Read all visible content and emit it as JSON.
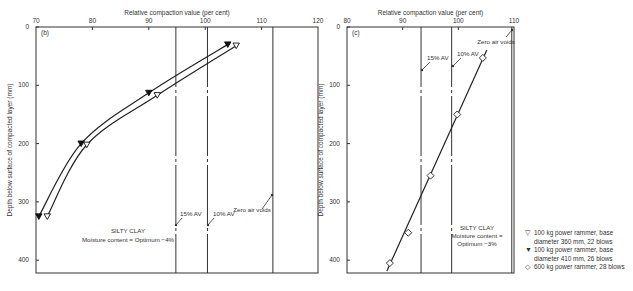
{
  "chart_data": [
    {
      "type": "line",
      "panel_label": "(b)",
      "title": "",
      "xlabel": "Relative compaction value (per cent)",
      "ylabel": "Depth below surface of compacted layer (mm)",
      "xlim": [
        70,
        120
      ],
      "ylim": [
        0,
        422
      ],
      "x_ticks": [
        "70",
        "80",
        "90",
        "100",
        "110",
        "120"
      ],
      "y_ticks": [
        "0",
        "100",
        "200",
        "300",
        "400"
      ],
      "grid": false,
      "annotation": [
        "SILTY CLAY",
        "Moisture content = Optimum −4%"
      ],
      "reference_lines": [
        {
          "label": "15% AV",
          "x": 94.8,
          "style": "dash-dot"
        },
        {
          "label": "10% AV",
          "x": 100.4,
          "style": "dash-dot"
        },
        {
          "label": "Zero air voids",
          "x": 112,
          "style": "solid"
        }
      ],
      "series": [
        {
          "name": "100 kg power rammer, base diameter 360 mm, 22 blows",
          "marker": "open-triangle-down",
          "points": [
            [
              105.5,
              32
            ],
            [
              91.5,
              117
            ],
            [
              79,
              202
            ],
            [
              72,
              325
            ]
          ]
        },
        {
          "name": "100 kg power rammer, base diameter 410 mm, 26 blows",
          "marker": "filled-triangle-down",
          "points": [
            [
              104,
              30
            ],
            [
              90,
              113
            ],
            [
              78,
              200
            ],
            [
              70.5,
              325
            ]
          ]
        }
      ]
    },
    {
      "type": "line",
      "panel_label": "(c)",
      "title": "",
      "xlabel": "Relative compaction value (per cent)",
      "ylabel": "Depth below surface of compacted layer (mm)",
      "xlim": [
        80,
        110
      ],
      "ylim": [
        0,
        422
      ],
      "x_ticks": [
        "80",
        "90",
        "100",
        "110"
      ],
      "y_ticks": [
        "0",
        "100",
        "200",
        "300",
        "400"
      ],
      "grid": false,
      "annotation": [
        "SILTY CLAY",
        "Moisture content =",
        "Optimum −3%"
      ],
      "reference_lines": [
        {
          "label": "15% AV",
          "x": 93.3,
          "style": "dash-dot"
        },
        {
          "label": "10% AV",
          "x": 98.8,
          "style": "dash-dot"
        },
        {
          "label": "Zero air voids",
          "x": 109.6,
          "style": "solid"
        }
      ],
      "series": [
        {
          "name": "600 kg power rammer, 28 blows",
          "marker": "open-diamond",
          "points": [
            [
              104.4,
              53
            ],
            [
              99.8,
              150
            ],
            [
              95,
              255
            ],
            [
              91,
              353
            ],
            [
              87.7,
              405
            ]
          ]
        }
      ]
    }
  ],
  "legend": [
    {
      "symbol": "▽",
      "lines": [
        "100 kg power rammer, base",
        "diameter 360 mm, 22 blows"
      ]
    },
    {
      "symbol": "▼",
      "lines": [
        "100 kg power rammer, base",
        "diameter 410 mm, 26 blows"
      ]
    },
    {
      "symbol": "◇",
      "lines": [
        "600 kg power rammer, 28 blows"
      ]
    }
  ]
}
